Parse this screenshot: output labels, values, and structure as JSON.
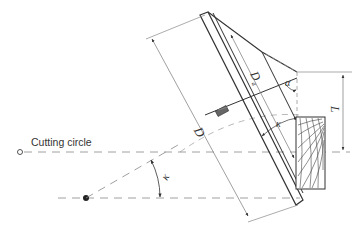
{
  "diagram": {
    "labels": {
      "cutting_circle": "Cutting circle",
      "diameter": "D",
      "diameter_a": "D",
      "diameter_a_sub": "a",
      "angle_alpha": "α",
      "angle_kappa_top": "κ",
      "angle_kappa_bottom": "κ",
      "length": "L"
    },
    "colors": {
      "outline": "#333333",
      "dim_line": "#777777",
      "dash_line": "#888888",
      "tooth": "#555555"
    }
  }
}
